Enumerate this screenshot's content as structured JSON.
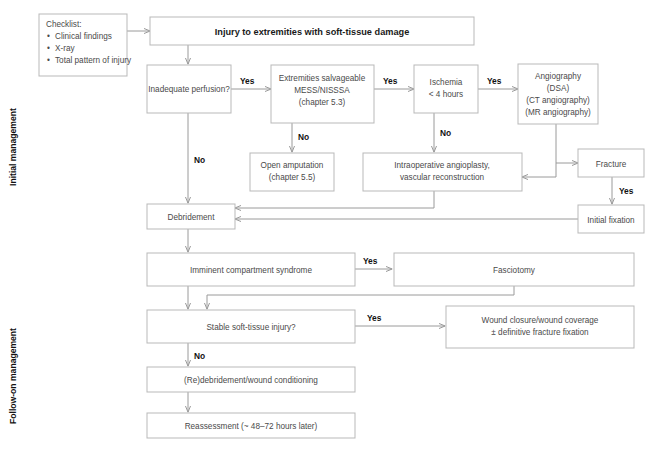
{
  "diagram": {
    "title": "Injury to extremities with soft-tissue damage",
    "side_labels": [
      {
        "id": "initial",
        "text": "Initial management"
      },
      {
        "id": "followon",
        "text": "Follow-on management"
      }
    ],
    "checklist": {
      "heading": "Checklist:",
      "items": [
        "Clinical findings",
        "X-ray",
        "Total pattern of injury"
      ]
    },
    "nodes": [
      {
        "id": "title",
        "lines": [
          "Injury to extremities with soft-tissue damage"
        ]
      },
      {
        "id": "perfusion",
        "lines": [
          "Inadequate perfusion?"
        ]
      },
      {
        "id": "salvageable",
        "lines": [
          "Extremities salvageable",
          "MESS/NISSSA",
          "(chapter 5.3)"
        ]
      },
      {
        "id": "ischemia",
        "lines": [
          "Ischemia",
          "< 4 hours"
        ]
      },
      {
        "id": "angiography",
        "lines": [
          "Angiography",
          "(DSA)",
          "(CT angiography)",
          "(MR angiography)"
        ]
      },
      {
        "id": "amputation",
        "lines": [
          "Open amputation",
          "(chapter 5.5)"
        ]
      },
      {
        "id": "intraop",
        "lines": [
          "Intraoperative angioplasty,",
          "vascular reconstruction"
        ]
      },
      {
        "id": "fracture",
        "lines": [
          "Fracture"
        ]
      },
      {
        "id": "initialfix",
        "lines": [
          "Initial fixation"
        ]
      },
      {
        "id": "debridement",
        "lines": [
          "Debridement"
        ]
      },
      {
        "id": "compartment",
        "lines": [
          "Imminent compartment syndrome"
        ]
      },
      {
        "id": "fasciotomy",
        "lines": [
          "Fasciotomy"
        ]
      },
      {
        "id": "stable",
        "lines": [
          "Stable soft-tissue injury?"
        ]
      },
      {
        "id": "woundclosure",
        "lines": [
          "Wound closure/wound coverage",
          "± definitive fracture fixation"
        ]
      },
      {
        "id": "redebride",
        "lines": [
          "(Re)debridement/wound conditioning"
        ]
      },
      {
        "id": "reassessment",
        "lines": [
          "Reassessment (~ 48–72 hours later)"
        ]
      }
    ],
    "edge_labels": [
      {
        "id": "yes-perfusion",
        "text": "Yes"
      },
      {
        "id": "yes-salvageable",
        "text": "Yes"
      },
      {
        "id": "yes-ischemia",
        "text": "Yes"
      },
      {
        "id": "no-perfusion",
        "text": "No"
      },
      {
        "id": "no-salvageable",
        "text": "No"
      },
      {
        "id": "no-ischemia",
        "text": "No"
      },
      {
        "id": "yes-fracture",
        "text": "Yes"
      },
      {
        "id": "yes-compartment",
        "text": "Yes"
      },
      {
        "id": "yes-stable",
        "text": "Yes"
      },
      {
        "id": "no-stable",
        "text": "No"
      }
    ],
    "colors": {
      "box_border": "#b9b9b9",
      "box_fill": "#ffffff",
      "text": "#4a4a4a",
      "bold_text": "#111111",
      "edge": "#9a9a9a"
    }
  }
}
